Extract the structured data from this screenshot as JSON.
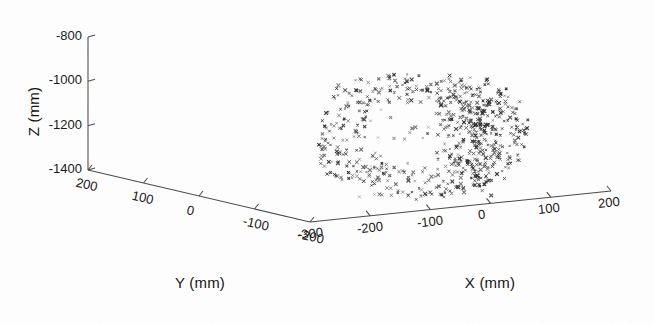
{
  "figure": {
    "kind": "3d-scatter-plot",
    "style": "matlab-scatter3-grayscale-scan",
    "background_color": "#fefefe",
    "marker_color": "#2b2b2b",
    "axis_color": "#4a4a4a"
  },
  "labels": {
    "z_axis_title": "Z (mm)",
    "y_axis_title": "Y (mm)",
    "x_axis_title": "X (mm)"
  },
  "ticks": {
    "z": [
      "-800",
      "-1000",
      "-1200",
      "-1400"
    ],
    "y": [
      "200",
      "100",
      "0",
      "-100",
      "-200"
    ],
    "x": [
      "-300",
      "-200",
      "-100",
      "0",
      "100",
      "200"
    ]
  },
  "chart_data": {
    "type": "scatter",
    "projection": "3d",
    "title": "",
    "xlabel": "X (mm)",
    "ylabel": "Y (mm)",
    "zlabel": "Z (mm)",
    "xlim": [
      -300,
      200
    ],
    "ylim": [
      -200,
      200
    ],
    "zlim": [
      -1400,
      -800
    ],
    "xticks": [
      -300,
      -200,
      -100,
      0,
      100,
      200
    ],
    "yticks": [
      200,
      100,
      0,
      -100,
      -200
    ],
    "zticks": [
      -1400,
      -1200,
      -1000,
      -800
    ],
    "grid": false,
    "legend": null,
    "marker": "x",
    "marker_size": 2,
    "series": [
      {
        "name": "point cloud",
        "n_points": 700,
        "shape": "annulus-ring-with-dense-right-cluster",
        "description": "Ring shaped 3D point cloud, hollow sparse centre, dense knot of points on the right-hand side of the ring",
        "generator": {
          "ring_fraction": 0.74,
          "ring_center_px": [
            418,
            134
          ],
          "ring_radius_x_px": 86,
          "ring_radius_y_px": 52,
          "ring_thickness_px": 26,
          "cluster_fraction": 0.2,
          "cluster_center_px": [
            466,
            133
          ],
          "cluster_spread_px": [
            16,
            26
          ],
          "scatter_fraction": 0.06,
          "interior_center_px": [
            405,
            136
          ],
          "interior_spread_px": [
            46,
            30
          ],
          "seed": 20250407
        }
      }
    ]
  },
  "axes_geometry": {
    "z_axis_px": {
      "x": 88,
      "y_top": 37,
      "y_bottom": 170
    },
    "y_axis_px": {
      "x1": 88,
      "y1": 170,
      "x2": 310,
      "y2": 222
    },
    "x_axis_px": {
      "x1": 310,
      "y1": 222,
      "x2": 611,
      "y2": 191
    }
  }
}
